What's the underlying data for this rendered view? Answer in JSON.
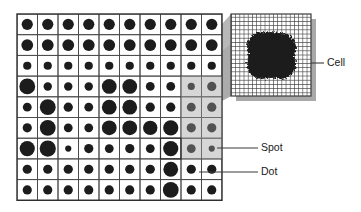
{
  "figure": {
    "background_color": "#ffffff",
    "ink_color": "#1c1c1c",
    "grid_line_color": "#4a4a4a",
    "shadow_color": "#a8a8a8",
    "highlight_color": "#9e9e9e",
    "cone_color": "#b5b5b5",
    "leader_color": "#3a3a3a"
  },
  "labels": [
    {
      "id": "cell",
      "text": "Cell",
      "text_x": 327,
      "text_y": 66,
      "leader_from_x": 311,
      "leader_from_y": 63,
      "leader_to_x": 324,
      "leader_to_y": 63
    },
    {
      "id": "spot",
      "text": "Spot",
      "text_x": 261,
      "text_y": 151,
      "leader_from_x": 217,
      "leader_from_y": 148,
      "leader_to_x": 258,
      "leader_to_y": 148
    },
    {
      "id": "dot",
      "text": "Dot",
      "text_x": 261,
      "text_y": 175,
      "leader_from_x": 199,
      "leader_from_y": 172,
      "leader_to_x": 258,
      "leader_to_y": 172
    }
  ],
  "halftone_grid": {
    "x": 17,
    "y": 14,
    "cell_width": 20.5,
    "cell_height": 20.7,
    "columns": 10,
    "rows": 9,
    "frame_stroke": 1.4,
    "cell_stroke": 0.9,
    "max_dot_radius": 8.4,
    "dot_radii": [
      [
        5.6,
        5.6,
        5.6,
        5.6,
        5.6,
        5.6,
        5.6,
        5.6,
        5.6,
        5.6
      ],
      [
        5.9,
        5.9,
        5.9,
        5.9,
        5.9,
        5.9,
        5.9,
        5.9,
        5.9,
        5.9
      ],
      [
        4.1,
        4.1,
        4.1,
        4.1,
        4.1,
        4.1,
        4.1,
        4.1,
        4.1,
        4.1
      ],
      [
        7.9,
        4.2,
        4.2,
        4.2,
        7.4,
        7.4,
        4.4,
        4.4,
        3.6,
        4.6
      ],
      [
        4.4,
        7.9,
        4.6,
        4.4,
        7.4,
        7.4,
        4.6,
        4.6,
        4.4,
        4.6
      ],
      [
        4.6,
        7.9,
        4.4,
        4.4,
        7.4,
        7.4,
        7.2,
        7.6,
        4.6,
        4.6
      ],
      [
        7.6,
        8.1,
        3.1,
        4.6,
        4.4,
        4.6,
        4.4,
        7.6,
        4.4,
        3.1
      ],
      [
        4.6,
        4.6,
        4.6,
        4.6,
        4.6,
        4.6,
        4.6,
        7.4,
        4.6,
        4.6
      ],
      [
        4.6,
        4.6,
        4.6,
        4.6,
        4.6,
        4.6,
        4.6,
        7.9,
        4.6,
        4.6
      ]
    ]
  },
  "highlight_region": {
    "description": "shaded sampled spot region at right of halftone grid",
    "col_start": 8,
    "col_end": 10,
    "row_start": 3,
    "row_end": 7,
    "opacity": 0.42
  },
  "magnifier": {
    "description": "enlarged view of one halftone spot showing cell matrix",
    "x": 231,
    "y": 14,
    "width": 80,
    "height": 82,
    "cell_columns": 19,
    "cell_rows": 19,
    "cell_size": 4.2,
    "blob_center_x": 271,
    "blob_center_y": 55,
    "blob_radius": 24,
    "shadow_offset": 5
  },
  "cone": {
    "description": "perspective cone linking sampled spot to magnified view",
    "points": "181,70 231,14 231,96 158,134"
  }
}
